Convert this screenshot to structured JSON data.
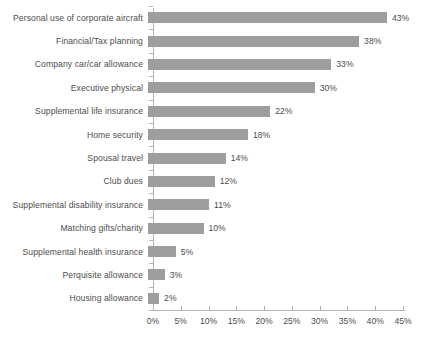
{
  "chart_data": {
    "type": "bar",
    "orientation": "horizontal",
    "title": "",
    "subtitle": "",
    "xlabel": "",
    "ylabel": "",
    "xlim": [
      0,
      45
    ],
    "xtick_step": 5,
    "grid": false,
    "legend": null,
    "bar_color": "#9e9e9e",
    "text_color": "#4d4d4d",
    "axis_color": "#b3b3b3",
    "background": "#ffffff",
    "value_suffix": "%",
    "categories": [
      "Personal use of corporate aircraft",
      "Financial/Tax planning",
      "Company car/car allowance",
      "Executive physical",
      "Supplemental life insurance",
      "Home security",
      "Spousal travel",
      "Club dues",
      "Supplemental disability insurance",
      "Matching gifts/charity",
      "Supplemental health insurance",
      "Perquisite allowance",
      "Housing allowance"
    ],
    "values": [
      43,
      38,
      33,
      30,
      22,
      18,
      14,
      12,
      11,
      10,
      5,
      3,
      2
    ],
    "data_labels": [
      "43%",
      "38%",
      "33%",
      "30%",
      "22%",
      "18%",
      "14%",
      "12%",
      "11%",
      "10%",
      "5%",
      "3%",
      "2%"
    ],
    "xtick_labels": [
      "0%",
      "5%",
      "10%",
      "15%",
      "20%",
      "25%",
      "30%",
      "35%",
      "40%",
      "45%"
    ],
    "xtick_values": [
      0,
      5,
      10,
      15,
      20,
      25,
      30,
      35,
      40,
      45
    ]
  }
}
